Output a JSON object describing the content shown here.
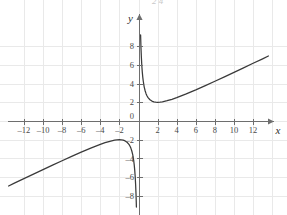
{
  "figure": {
    "background_color": "#ffffff",
    "grid_color": "#e9e9e9",
    "axis_color": "#6e6e6e",
    "curve_color": "#3a3a3a",
    "x_axis_name": "x",
    "y_axis_name": "y",
    "origin_label": "0",
    "top_cutoff_fragment": "2    4"
  },
  "chart_data": {
    "type": "line",
    "title": "",
    "subtitle": "",
    "xlabel": "x",
    "ylabel": "y",
    "xlim": [
      -13.8,
      14.0
    ],
    "ylim": [
      -9.6,
      9.4
    ],
    "grid": true,
    "grid_step": 2,
    "legend": "none",
    "x_ticks": [
      -12,
      -10,
      -8,
      -6,
      -4,
      -2,
      0,
      2,
      4,
      6,
      8,
      10,
      12
    ],
    "x_tick_labels": [
      "-12",
      "-10",
      "-8",
      "-6",
      "-4",
      "-2",
      "0",
      "2",
      "4",
      "6",
      "8",
      "10",
      "12"
    ],
    "y_ticks": [
      -8,
      -6,
      -4,
      -2,
      2,
      4,
      6,
      8
    ],
    "y_tick_labels": [
      "-8",
      "-6",
      "-4",
      "-2",
      "2",
      "4",
      "6",
      "8"
    ],
    "asymptotes": {
      "vertical": [
        0
      ],
      "oblique": [
        "y = x/2"
      ]
    },
    "annotations": [
      {
        "text": "local minimum",
        "x": 2,
        "y": 2
      },
      {
        "text": "local maximum",
        "x": -2,
        "y": -2
      }
    ],
    "series": [
      {
        "name": "right branch",
        "expression": "y = x/2 + 2/x",
        "x": [
          0.22,
          0.26,
          0.3,
          0.35,
          0.4,
          0.45,
          0.5,
          0.6,
          0.7,
          0.8,
          0.9,
          1.0,
          1.2,
          1.4,
          1.6,
          1.8,
          2.0,
          2.25,
          2.5,
          3.0,
          3.5,
          4.0,
          5.0,
          6.0,
          7.0,
          8.0,
          9.0,
          10.0,
          11.0,
          12.0,
          13.0,
          13.6
        ],
        "y": [
          9.2,
          7.82,
          6.82,
          5.89,
          5.2,
          4.67,
          4.25,
          3.63,
          3.21,
          2.9,
          2.67,
          2.5,
          2.27,
          2.13,
          2.05,
          2.01,
          2.0,
          2.01,
          2.05,
          2.17,
          2.32,
          2.5,
          2.9,
          3.33,
          3.79,
          4.25,
          4.72,
          5.2,
          5.68,
          6.17,
          6.65,
          6.95
        ]
      },
      {
        "name": "left branch",
        "expression": "y = x/2 + 2/x",
        "x": [
          -13.6,
          -13.0,
          -12.0,
          -11.0,
          -10.0,
          -9.0,
          -8.0,
          -7.0,
          -6.0,
          -5.0,
          -4.0,
          -3.5,
          -3.0,
          -2.5,
          -2.25,
          -2.0,
          -1.8,
          -1.6,
          -1.4,
          -1.2,
          -1.0,
          -0.9,
          -0.8,
          -0.7,
          -0.6,
          -0.5,
          -0.45,
          -0.4,
          -0.35,
          -0.3,
          -0.26,
          -0.22
        ],
        "y": [
          -6.95,
          -6.65,
          -6.17,
          -5.68,
          -5.2,
          -4.72,
          -4.25,
          -3.79,
          -3.33,
          -2.9,
          -2.5,
          -2.32,
          -2.17,
          -2.05,
          -2.01,
          -2.0,
          -2.01,
          -2.05,
          -2.13,
          -2.27,
          -2.5,
          -2.67,
          -2.9,
          -3.21,
          -3.63,
          -4.25,
          -4.67,
          -5.2,
          -5.89,
          -6.82,
          -7.82,
          -9.2
        ]
      }
    ]
  }
}
